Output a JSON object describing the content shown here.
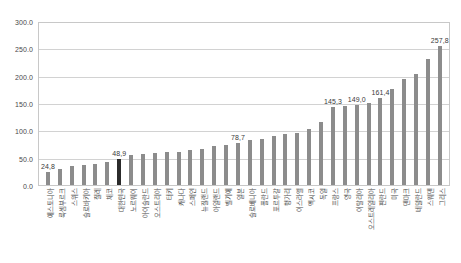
{
  "chart_data": {
    "type": "bar",
    "title": "",
    "subtitle": "",
    "xlabel": "",
    "ylabel": "",
    "ylim": [
      0,
      300
    ],
    "ytick_labels": [
      "300.0",
      "250.0",
      "200.0",
      "150.0",
      "100.0",
      "50.0",
      "0.0"
    ],
    "ytick_values": [
      300,
      250,
      200,
      150,
      100,
      50,
      0
    ],
    "grid": true,
    "legend": "none",
    "highlight_category": "대한민국",
    "highlight_color": "#2b2b2b",
    "bar_color": "#8c8c8c",
    "decimal_separator": ",",
    "categories": [
      "에스토니아",
      "룩셈부르크",
      "스위스",
      "슬로바키아",
      "칠레",
      "체코",
      "대한민국",
      "노르웨이",
      "아이슬란드",
      "오스트리아",
      "터키",
      "캐나다",
      "스페인",
      "뉴질랜드",
      "아일랜드",
      "벨기에",
      "일본",
      "슬로베니아",
      "폴란드",
      "포르투갈",
      "헝가리",
      "이스라엘",
      "멕시코",
      "독일",
      "프랑스",
      "영국",
      "이탈리아",
      "오스트레일리아",
      "핀란드",
      "미국",
      "덴마크",
      "네덜란드",
      "스웨덴",
      "그리스"
    ],
    "values": [
      24.8,
      30.0,
      35.5,
      37.0,
      38.5,
      43.0,
      48.9,
      55.0,
      57.0,
      58.5,
      61.5,
      62.0,
      65.0,
      67.0,
      72.0,
      74.5,
      78.7,
      84.0,
      86.0,
      90.0,
      94.0,
      97.0,
      104.0,
      116.0,
      145.3,
      147.0,
      149.0,
      152.0,
      161.4,
      178.0,
      196.0,
      205.0,
      233.0,
      257.8
    ],
    "value_labels": [
      {
        "category": "에스토니아",
        "index": 0,
        "text": "24,8"
      },
      {
        "category": "대한민국",
        "index": 6,
        "text": "48,9"
      },
      {
        "category": "일본",
        "index": 16,
        "text": "78,7"
      },
      {
        "category": "프랑스",
        "index": 24,
        "text": "145,3"
      },
      {
        "category": "이탈리아",
        "index": 26,
        "text": "149,0"
      },
      {
        "category": "핀란드",
        "index": 28,
        "text": "161,4"
      },
      {
        "category": "그리스",
        "index": 33,
        "text": "257,8"
      }
    ]
  }
}
